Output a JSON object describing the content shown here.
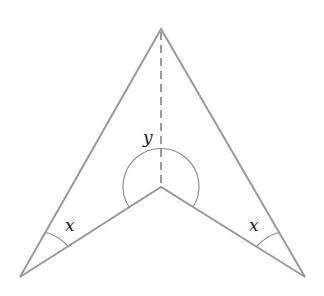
{
  "diagram": {
    "type": "arrowhead-quadrilateral",
    "vertices": {
      "top": [
        161,
        29
      ],
      "reflex": [
        161,
        187
      ],
      "bottom_left": [
        20,
        277
      ],
      "bottom_right": [
        305,
        277
      ]
    },
    "labels": {
      "reflex_angle": "y",
      "bottom_left_angle": "x",
      "bottom_right_angle": "x"
    },
    "colors": {
      "stroke": "#9a9a9a",
      "label": "#1a1a1a",
      "background": "#ffffff"
    }
  }
}
